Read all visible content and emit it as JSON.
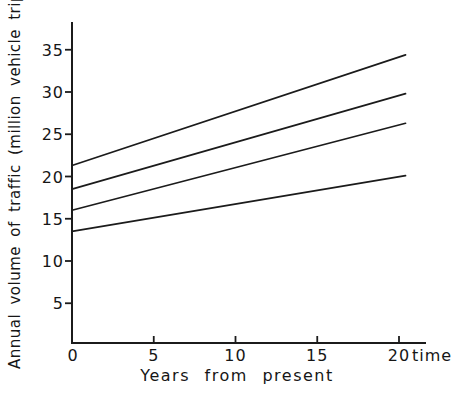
{
  "figure": {
    "y_axis_title": "Annual volume of traffic (million vehicle trips)",
    "x_axis_title": "Years from present",
    "time_label": "time",
    "line_color": "#1b1b1b",
    "background": "#ffffff"
  },
  "chart_data": {
    "type": "line",
    "title": "",
    "xlabel": "Years from present",
    "ylabel": "Annual volume of traffic (million vehicle trips)",
    "x_unit_annotation": "time",
    "x_ticks": [
      0,
      5,
      10,
      15,
      20
    ],
    "y_ticks": [
      5,
      10,
      15,
      20,
      25,
      30,
      35
    ],
    "xlim": [
      0,
      21.6
    ],
    "ylim": [
      0,
      38
    ],
    "grid": false,
    "legend": "none",
    "marker": "none",
    "series": [
      {
        "name": "forecast-line-1",
        "x": [
          0,
          20.4
        ],
        "values": [
          21.3,
          34.4
        ]
      },
      {
        "name": "forecast-line-2",
        "x": [
          0,
          20.4
        ],
        "values": [
          18.5,
          29.8
        ]
      },
      {
        "name": "forecast-line-3",
        "x": [
          0,
          20.4
        ],
        "values": [
          16.0,
          26.3
        ]
      },
      {
        "name": "forecast-line-4",
        "x": [
          0,
          20.4
        ],
        "values": [
          13.5,
          20.1
        ]
      }
    ]
  }
}
